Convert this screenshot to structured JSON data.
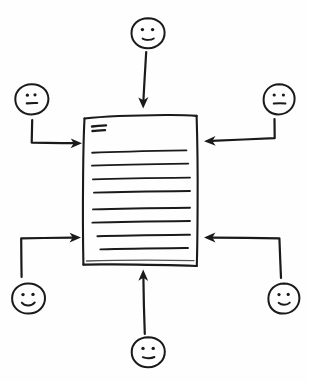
{
  "diagram": {
    "title": "Hand-drawn sketch: six people providing input to a central document",
    "type": "hand-drawn-diagram",
    "background_color": "#fefefe",
    "ink_color": "#1a1a1a",
    "canvas": {
      "width": 309,
      "height": 382
    },
    "center_node": {
      "name": "document",
      "shape": "rectangle",
      "style": "hand-drawn",
      "bounds": {
        "x": 83,
        "y": 115,
        "width": 114,
        "height": 150
      },
      "heading_mark": {
        "name": "double-dash-heading",
        "strokes": 2,
        "x": 92,
        "y": 127
      },
      "text_lines": [
        {
          "index": 1,
          "y": 152,
          "x1": 92,
          "x2": 186
        },
        {
          "index": 2,
          "y": 165,
          "x1": 92,
          "x2": 188
        },
        {
          "index": 3,
          "y": 179,
          "x1": 93,
          "x2": 190
        },
        {
          "index": 4,
          "y": 192,
          "x1": 94,
          "x2": 190
        },
        {
          "index": 5,
          "y": 209,
          "x1": 93,
          "x2": 190
        },
        {
          "index": 6,
          "y": 222,
          "x1": 92,
          "x2": 190
        },
        {
          "index": 7,
          "y": 236,
          "x1": 97,
          "x2": 190
        },
        {
          "index": 8,
          "y": 249,
          "x1": 100,
          "x2": 188
        }
      ],
      "text_line_count": 8
    },
    "faces": [
      {
        "id": "face-top-center",
        "position": "top-center",
        "cx": 148,
        "cy": 33,
        "rx": 16,
        "ry": 15,
        "expression": "smile",
        "eyes": "two-dots",
        "mouth": "short-curve"
      },
      {
        "id": "face-top-left",
        "position": "top-left",
        "cx": 32,
        "cy": 99,
        "rx": 16,
        "ry": 15,
        "expression": "neutral",
        "eyes": "two-dots",
        "mouth": "straight-line"
      },
      {
        "id": "face-top-right",
        "position": "top-right",
        "cx": 279,
        "cy": 99,
        "rx": 15,
        "ry": 15,
        "expression": "neutral",
        "eyes": "two-dots",
        "mouth": "straight-line"
      },
      {
        "id": "face-bottom-left",
        "position": "bottom-left",
        "cx": 28,
        "cy": 298,
        "rx": 16,
        "ry": 15,
        "expression": "smile",
        "eyes": "two-dots",
        "mouth": "curve"
      },
      {
        "id": "face-bottom-right",
        "position": "bottom-right",
        "cx": 284,
        "cy": 298,
        "rx": 15,
        "ry": 15,
        "expression": "smile",
        "eyes": "two-dots",
        "mouth": "short-curve"
      },
      {
        "id": "face-bottom-center",
        "position": "bottom-center",
        "cx": 148,
        "cy": 352,
        "rx": 16,
        "ry": 15,
        "expression": "smile",
        "eyes": "two-dots",
        "mouth": "short-curve"
      }
    ],
    "arrows": [
      {
        "id": "arrow-top-center",
        "from": "face-top-center",
        "to": "document",
        "direction": "down",
        "shape": "straight",
        "head_at": {
          "x": 143,
          "y": 107
        }
      },
      {
        "id": "arrow-top-left",
        "from": "face-top-left",
        "to": "document",
        "direction": "right",
        "shape": "elbow-down-right",
        "head_at": {
          "x": 81,
          "y": 143
        }
      },
      {
        "id": "arrow-top-right",
        "from": "face-top-right",
        "to": "document",
        "direction": "left",
        "shape": "elbow-down-left",
        "head_at": {
          "x": 203,
          "y": 141
        }
      },
      {
        "id": "arrow-bottom-left",
        "from": "face-bottom-left",
        "to": "document",
        "direction": "right",
        "shape": "elbow-up-right",
        "head_at": {
          "x": 80,
          "y": 238
        }
      },
      {
        "id": "arrow-bottom-right",
        "from": "face-bottom-right",
        "to": "document",
        "direction": "left",
        "shape": "elbow-up-left",
        "head_at": {
          "x": 203,
          "y": 238
        }
      },
      {
        "id": "arrow-bottom-center",
        "from": "face-bottom-center",
        "to": "document",
        "direction": "up",
        "shape": "straight",
        "head_at": {
          "x": 143,
          "y": 270
        }
      }
    ],
    "arrow_count": 6,
    "face_count": 6
  }
}
